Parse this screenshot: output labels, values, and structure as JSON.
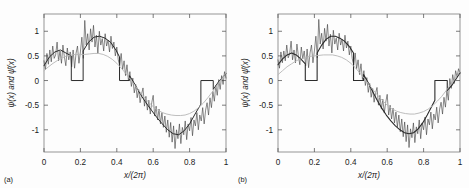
{
  "figure": {
    "background_color": "#fdfdfd",
    "panel_count": 2,
    "axis_color": "#8a8a8a",
    "tick_color": "#5a5a5a"
  },
  "chart_data": [
    {
      "type": "line",
      "panel_tag": "(a)",
      "title": "",
      "xlabel": "x/(2π)",
      "ylabel": "ψ(x) and ψ̂(x)",
      "xlim": [
        0,
        1
      ],
      "ylim": [
        -1.45,
        1.35
      ],
      "xticks": [
        0,
        0.2,
        0.4,
        0.6,
        0.8,
        1
      ],
      "xticklabels": [
        "0",
        "0.2",
        "0.4",
        "0.6",
        "0.8",
        "1"
      ],
      "yticks": [
        -1,
        -0.5,
        0,
        0.5,
        1
      ],
      "yticklabels": [
        "-1",
        "-0.5",
        "0",
        "0.5",
        "1"
      ],
      "grid": false,
      "legend": "none",
      "series": [
        {
          "name": "noisy-signal",
          "color": "#3d3d3d",
          "width": 0.6,
          "style": "jagged",
          "x": [
            0.0,
            0.008,
            0.016,
            0.024,
            0.032,
            0.04,
            0.048,
            0.056,
            0.064,
            0.072,
            0.08,
            0.088,
            0.096,
            0.104,
            0.112,
            0.12,
            0.128,
            0.136,
            0.144,
            0.152,
            0.16,
            0.168,
            0.176,
            0.184,
            0.192,
            0.2,
            0.208,
            0.216,
            0.224,
            0.232,
            0.24,
            0.248,
            0.256,
            0.264,
            0.272,
            0.28,
            0.288,
            0.296,
            0.304,
            0.312,
            0.32,
            0.328,
            0.336,
            0.344,
            0.352,
            0.36,
            0.368,
            0.376,
            0.384,
            0.392,
            0.4,
            0.408,
            0.416,
            0.424,
            0.432,
            0.44,
            0.448,
            0.456,
            0.464,
            0.472,
            0.48,
            0.488,
            0.496,
            0.504,
            0.512,
            0.52,
            0.528,
            0.536,
            0.544,
            0.552,
            0.56,
            0.568,
            0.576,
            0.584,
            0.592,
            0.6,
            0.608,
            0.616,
            0.624,
            0.632,
            0.64,
            0.648,
            0.656,
            0.664,
            0.672,
            0.68,
            0.688,
            0.696,
            0.704,
            0.712,
            0.72,
            0.728,
            0.736,
            0.744,
            0.752,
            0.76,
            0.768,
            0.776,
            0.784,
            0.792,
            0.8,
            0.808,
            0.816,
            0.824,
            0.832,
            0.84,
            0.848,
            0.856,
            0.864,
            0.872,
            0.88,
            0.888,
            0.896,
            0.904,
            0.912,
            0.92,
            0.928,
            0.936,
            0.944,
            0.952,
            0.96,
            0.968,
            0.976,
            0.984,
            0.992,
            1.0
          ],
          "y": [
            0.4,
            0.22,
            0.55,
            0.33,
            0.62,
            0.38,
            0.7,
            0.45,
            0.52,
            0.78,
            0.4,
            0.6,
            0.35,
            0.72,
            0.48,
            0.3,
            0.66,
            0.42,
            0.58,
            0.28,
            0.62,
            0.25,
            0.55,
            0.7,
            0.35,
            0.58,
            0.88,
            0.45,
            1.22,
            0.72,
            0.95,
            0.62,
            1.05,
            0.78,
            1.12,
            0.68,
            0.92,
            0.55,
            1.0,
            0.72,
            0.85,
            0.6,
            0.95,
            0.7,
            0.82,
            0.58,
            0.9,
            0.65,
            0.78,
            0.5,
            0.68,
            0.42,
            0.3,
            0.55,
            0.22,
            0.4,
            0.1,
            0.32,
            0.0,
            0.18,
            -0.12,
            0.05,
            -0.25,
            -0.08,
            -0.35,
            -0.18,
            -0.45,
            -0.28,
            -0.15,
            -0.52,
            -0.32,
            -0.6,
            -0.4,
            -0.68,
            -0.45,
            -0.3,
            -0.72,
            -0.52,
            -0.8,
            -0.58,
            -0.88,
            -0.65,
            -0.95,
            -0.72,
            -1.05,
            -0.8,
            -1.15,
            -0.85,
            -1.25,
            -0.92,
            -1.38,
            -1.0,
            -1.18,
            -0.88,
            -1.28,
            -0.95,
            -1.1,
            -0.82,
            -1.2,
            -0.88,
            -1.02,
            -0.75,
            -1.12,
            -0.8,
            -0.92,
            -0.65,
            -1.0,
            -0.7,
            -0.82,
            -0.55,
            -0.88,
            -0.6,
            -0.45,
            -0.7,
            -0.35,
            -0.55,
            -0.22,
            -0.42,
            -0.1,
            -0.3,
            0.02,
            -0.18,
            0.1,
            -0.08,
            0.18,
            0.05,
            0.22,
            0.12
          ]
        },
        {
          "name": "thresholded-reconstruction",
          "color": "#2b2b2b",
          "width": 1.0,
          "style": "piecewise",
          "x": [
            0.0,
            0.03,
            0.06,
            0.09,
            0.12,
            0.15,
            0.15,
            0.215,
            0.215,
            0.245,
            0.275,
            0.305,
            0.335,
            0.365,
            0.395,
            0.415,
            0.415,
            0.47,
            0.47,
            0.5,
            0.53,
            0.56,
            0.59,
            0.62,
            0.65,
            0.68,
            0.71,
            0.74,
            0.77,
            0.8,
            0.83,
            0.862,
            0.862,
            0.93,
            0.93,
            0.96,
            1.0
          ],
          "y": [
            0.3,
            0.48,
            0.58,
            0.62,
            0.56,
            0.5,
            0.0,
            0.0,
            0.6,
            0.78,
            0.88,
            0.9,
            0.86,
            0.78,
            0.62,
            0.48,
            0.0,
            0.0,
            0.1,
            -0.08,
            -0.28,
            -0.45,
            -0.6,
            -0.75,
            -0.88,
            -1.0,
            -1.08,
            -1.1,
            -1.02,
            -0.88,
            -0.68,
            -0.48,
            0.0,
            0.0,
            -0.18,
            -0.02,
            0.14
          ]
        },
        {
          "name": "smooth-approximation",
          "color": "#b5b5b5",
          "width": 0.9,
          "style": "smooth",
          "amplitude": 0.52,
          "phase": 0.06,
          "x": [
            0.0,
            0.025,
            0.05,
            0.075,
            0.1,
            0.125,
            0.15,
            0.175,
            0.2,
            0.225,
            0.25,
            0.275,
            0.3,
            0.325,
            0.35,
            0.375,
            0.4,
            0.425,
            0.45,
            0.475,
            0.5,
            0.525,
            0.55,
            0.575,
            0.6,
            0.625,
            0.65,
            0.675,
            0.7,
            0.725,
            0.75,
            0.775,
            0.8,
            0.825,
            0.85,
            0.875,
            0.9,
            0.925,
            0.95,
            0.975,
            1.0
          ],
          "y": [
            0.2,
            0.28,
            0.35,
            0.41,
            0.46,
            0.5,
            0.52,
            0.53,
            0.53,
            0.53,
            0.54,
            0.55,
            0.55,
            0.53,
            0.49,
            0.43,
            0.35,
            0.25,
            0.14,
            0.02,
            -0.1,
            -0.22,
            -0.34,
            -0.44,
            -0.53,
            -0.6,
            -0.65,
            -0.68,
            -0.7,
            -0.71,
            -0.71,
            -0.7,
            -0.67,
            -0.62,
            -0.55,
            -0.46,
            -0.35,
            -0.23,
            -0.1,
            0.03,
            0.15
          ]
        }
      ]
    },
    {
      "type": "line",
      "panel_tag": "(b)",
      "title": "",
      "xlabel": "x/(2π)",
      "ylabel": "ψ(x) and ψ̂(x)",
      "xlim": [
        0,
        1
      ],
      "ylim": [
        -1.45,
        1.35
      ],
      "xticks": [
        0,
        0.2,
        0.4,
        0.6,
        0.8,
        1
      ],
      "xticklabels": [
        "0",
        "0.2",
        "0.4",
        "0.6",
        "0.8",
        "1"
      ],
      "yticks": [
        -1,
        -0.5,
        0,
        0.5,
        1
      ],
      "yticklabels": [
        "-1",
        "-0.5",
        "0",
        "0.5",
        "1"
      ],
      "grid": false,
      "legend": "none",
      "series": [
        {
          "name": "noisy-signal",
          "color": "#3d3d3d",
          "width": 0.6,
          "style": "jagged",
          "x": [
            0.0,
            0.008,
            0.016,
            0.024,
            0.032,
            0.04,
            0.048,
            0.056,
            0.064,
            0.072,
            0.08,
            0.088,
            0.096,
            0.104,
            0.112,
            0.12,
            0.128,
            0.136,
            0.144,
            0.152,
            0.16,
            0.168,
            0.176,
            0.184,
            0.192,
            0.2,
            0.208,
            0.216,
            0.224,
            0.232,
            0.24,
            0.248,
            0.256,
            0.264,
            0.272,
            0.28,
            0.288,
            0.296,
            0.304,
            0.312,
            0.32,
            0.328,
            0.336,
            0.344,
            0.352,
            0.36,
            0.368,
            0.376,
            0.384,
            0.392,
            0.4,
            0.408,
            0.416,
            0.424,
            0.432,
            0.44,
            0.448,
            0.456,
            0.464,
            0.472,
            0.48,
            0.488,
            0.496,
            0.504,
            0.512,
            0.52,
            0.528,
            0.536,
            0.544,
            0.552,
            0.56,
            0.568,
            0.576,
            0.584,
            0.592,
            0.6,
            0.608,
            0.616,
            0.624,
            0.632,
            0.64,
            0.648,
            0.656,
            0.664,
            0.672,
            0.68,
            0.688,
            0.696,
            0.704,
            0.712,
            0.72,
            0.728,
            0.736,
            0.744,
            0.752,
            0.76,
            0.768,
            0.776,
            0.784,
            0.792,
            0.8,
            0.808,
            0.816,
            0.824,
            0.832,
            0.84,
            0.848,
            0.856,
            0.864,
            0.872,
            0.88,
            0.888,
            0.896,
            0.904,
            0.912,
            0.92,
            0.928,
            0.936,
            0.944,
            0.952,
            0.96,
            0.968,
            0.976,
            0.984,
            0.992,
            1.0
          ],
          "y": [
            0.42,
            0.25,
            0.58,
            0.36,
            0.6,
            0.4,
            0.72,
            0.46,
            0.54,
            0.8,
            0.42,
            0.62,
            0.36,
            0.74,
            0.5,
            0.32,
            0.68,
            0.44,
            0.6,
            0.3,
            0.64,
            0.26,
            0.56,
            0.72,
            0.36,
            0.6,
            0.9,
            0.46,
            1.24,
            0.74,
            0.96,
            0.64,
            1.06,
            0.8,
            1.14,
            0.7,
            0.94,
            0.56,
            1.02,
            0.74,
            0.86,
            0.62,
            0.96,
            0.72,
            0.84,
            0.6,
            0.92,
            0.66,
            0.8,
            0.52,
            0.7,
            0.44,
            0.32,
            0.56,
            0.24,
            0.42,
            0.12,
            0.34,
            0.02,
            0.2,
            -0.1,
            0.06,
            -0.24,
            -0.06,
            -0.34,
            -0.16,
            -0.44,
            -0.26,
            -0.14,
            -0.5,
            -0.3,
            -0.58,
            -0.38,
            -0.66,
            -0.44,
            -0.28,
            -0.7,
            -0.5,
            -0.78,
            -0.56,
            -0.86,
            -0.64,
            -0.94,
            -0.7,
            -1.04,
            -0.78,
            -1.14,
            -0.84,
            -1.24,
            -0.9,
            -1.36,
            -0.98,
            -1.16,
            -0.86,
            -1.26,
            -0.94,
            -1.08,
            -0.8,
            -1.18,
            -0.86,
            -1.0,
            -0.74,
            -1.1,
            -0.78,
            -0.9,
            -0.64,
            -0.98,
            -0.68,
            -0.8,
            -0.54,
            -0.86,
            -0.58,
            -0.44,
            -0.68,
            -0.34,
            -0.54,
            -0.2,
            -0.4,
            0.04,
            -0.16,
            0.12,
            -0.06,
            0.2,
            0.07,
            0.24,
            0.14
          ]
        },
        {
          "name": "thresholded-reconstruction",
          "color": "#2b2b2b",
          "width": 1.1,
          "style": "wavy",
          "x": [
            0.0,
            0.025,
            0.05,
            0.075,
            0.1,
            0.125,
            0.15,
            0.15,
            0.215,
            0.215,
            0.24,
            0.265,
            0.29,
            0.315,
            0.34,
            0.365,
            0.39,
            0.415,
            0.415,
            0.47,
            0.47,
            0.495,
            0.52,
            0.545,
            0.57,
            0.595,
            0.62,
            0.645,
            0.67,
            0.695,
            0.72,
            0.745,
            0.77,
            0.795,
            0.82,
            0.845,
            0.862,
            0.862,
            0.93,
            0.93,
            0.955,
            0.98,
            1.0
          ],
          "y": [
            0.32,
            0.44,
            0.52,
            0.56,
            0.52,
            0.44,
            0.34,
            0.0,
            0.0,
            0.56,
            0.72,
            0.84,
            0.9,
            0.9,
            0.86,
            0.8,
            0.7,
            0.56,
            0.0,
            0.0,
            0.12,
            -0.04,
            -0.22,
            -0.4,
            -0.56,
            -0.7,
            -0.82,
            -0.92,
            -1.0,
            -1.06,
            -1.08,
            -1.06,
            -0.98,
            -0.86,
            -0.7,
            -0.52,
            -0.4,
            0.0,
            0.0,
            -0.2,
            -0.1,
            0.04,
            0.16
          ]
        },
        {
          "name": "smooth-approximation",
          "color": "#b5b5b5",
          "width": 0.9,
          "style": "smooth",
          "amplitude": 0.5,
          "phase": 0.05,
          "x": [
            0.0,
            0.025,
            0.05,
            0.075,
            0.1,
            0.125,
            0.15,
            0.175,
            0.2,
            0.225,
            0.25,
            0.275,
            0.3,
            0.325,
            0.35,
            0.375,
            0.4,
            0.425,
            0.45,
            0.475,
            0.5,
            0.525,
            0.55,
            0.575,
            0.6,
            0.625,
            0.65,
            0.675,
            0.7,
            0.725,
            0.75,
            0.775,
            0.8,
            0.825,
            0.85,
            0.875,
            0.9,
            0.925,
            0.95,
            0.975,
            1.0
          ],
          "y": [
            0.12,
            0.2,
            0.28,
            0.34,
            0.4,
            0.44,
            0.47,
            0.49,
            0.5,
            0.51,
            0.52,
            0.52,
            0.52,
            0.5,
            0.47,
            0.42,
            0.35,
            0.26,
            0.15,
            0.04,
            -0.08,
            -0.2,
            -0.31,
            -0.41,
            -0.5,
            -0.57,
            -0.62,
            -0.65,
            -0.67,
            -0.68,
            -0.68,
            -0.66,
            -0.63,
            -0.58,
            -0.51,
            -0.42,
            -0.32,
            -0.2,
            -0.08,
            0.05,
            0.18
          ]
        }
      ]
    }
  ]
}
